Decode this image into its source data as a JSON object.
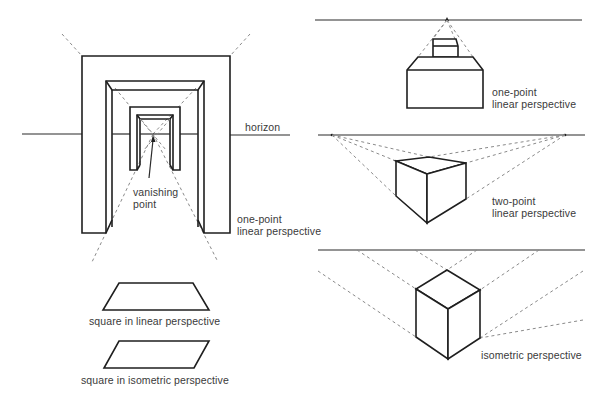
{
  "figure": {
    "panels": [
      {
        "id": "corridor",
        "labels": {
          "horizon": "horizon",
          "vanishing_point_line1": "vanishing",
          "vanishing_point_line2": "point",
          "caption_line1": "one-point",
          "caption_line2": "linear perspective"
        }
      },
      {
        "id": "squares",
        "labels": {
          "linear": "square in linear perspective",
          "isometric": "square in isometric perspective"
        }
      },
      {
        "id": "one-point-box",
        "labels": {
          "caption_line1": "one-point",
          "caption_line2": "linear perspective"
        }
      },
      {
        "id": "two-point-box",
        "labels": {
          "caption_line1": "two-point",
          "caption_line2": "linear perspective"
        }
      },
      {
        "id": "isometric-box",
        "labels": {
          "caption": "isometric perspective"
        }
      }
    ]
  }
}
